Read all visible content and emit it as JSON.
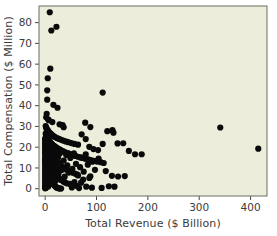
{
  "chart_data": {
    "type": "scatter",
    "title": "",
    "subtitle": "",
    "xlabel": "Total Revenue ($ Billion)",
    "ylabel": "Total Compensation ($ Million)",
    "xlim": [
      -12,
      432
    ],
    "ylim": [
      -3.5,
      88
    ],
    "xticks": [
      0,
      100,
      200,
      300,
      400
    ],
    "yticks": [
      0,
      10,
      20,
      30,
      40,
      50,
      60,
      70,
      80
    ],
    "xtick_labels": [
      "0",
      "100",
      "200",
      "300",
      "400"
    ],
    "ytick_labels": [
      "0",
      "10",
      "20",
      "30",
      "40",
      "50",
      "60",
      "70",
      "80"
    ],
    "grid": false,
    "legend": null,
    "legend_position": "none",
    "marker": "filled-circle",
    "marker_color": "#0a0a0a",
    "marker_size_px": 3.1,
    "plot_background_color": "#ECEDDA",
    "figure_background_color": "#FFFFFF",
    "axis_frame_color": "#6E6E62",
    "text_color": "#3B3B3B",
    "n_points": 318,
    "annotations": [],
    "points": [
      [
        9,
        85.0
      ],
      [
        12,
        76.2
      ],
      [
        22,
        78.0
      ],
      [
        10,
        57.8
      ],
      [
        5,
        53.2
      ],
      [
        4,
        47.4
      ],
      [
        4,
        42.9
      ],
      [
        16,
        40.4
      ],
      [
        24,
        39.0
      ],
      [
        112,
        46.3
      ],
      [
        3,
        36.1
      ],
      [
        2,
        34.4
      ],
      [
        6,
        33.3
      ],
      [
        7,
        33.0
      ],
      [
        14,
        32.1
      ],
      [
        28,
        31.0
      ],
      [
        34,
        30.6
      ],
      [
        36,
        29.6
      ],
      [
        78,
        31.8
      ],
      [
        88,
        29.7
      ],
      [
        341,
        29.5
      ],
      [
        415,
        19.3
      ],
      [
        1,
        30.2
      ],
      [
        2,
        29.4
      ],
      [
        3,
        28.8
      ],
      [
        5,
        28.2
      ],
      [
        6,
        27.6
      ],
      [
        8,
        27.1
      ],
      [
        10,
        26.7
      ],
      [
        12,
        26.2
      ],
      [
        14,
        25.7
      ],
      [
        17,
        25.2
      ],
      [
        20,
        24.8
      ],
      [
        23,
        24.4
      ],
      [
        27,
        24.0
      ],
      [
        31,
        23.6
      ],
      [
        35,
        23.2
      ],
      [
        40,
        22.8
      ],
      [
        45,
        22.4
      ],
      [
        51,
        22.0
      ],
      [
        57,
        21.6
      ],
      [
        64,
        21.2
      ],
      [
        71,
        26.2
      ],
      [
        79,
        23.9
      ],
      [
        86,
        20.2
      ],
      [
        94,
        19.1
      ],
      [
        103,
        18.6
      ],
      [
        112,
        21.6
      ],
      [
        121,
        27.7
      ],
      [
        131,
        28.2
      ],
      [
        133,
        27.0
      ],
      [
        141,
        21.8
      ],
      [
        152,
        21.9
      ],
      [
        163,
        18.2
      ],
      [
        175,
        16.6
      ],
      [
        188,
        16.6
      ],
      [
        1,
        26.5
      ],
      [
        2,
        25.9
      ],
      [
        2,
        25.4
      ],
      [
        3,
        25.0
      ],
      [
        4,
        24.6
      ],
      [
        5,
        24.2
      ],
      [
        6,
        23.8
      ],
      [
        7,
        23.4
      ],
      [
        8,
        23.0
      ],
      [
        9,
        22.6
      ],
      [
        10,
        22.2
      ],
      [
        11,
        21.9
      ],
      [
        13,
        21.5
      ],
      [
        14,
        21.2
      ],
      [
        16,
        20.8
      ],
      [
        18,
        20.5
      ],
      [
        20,
        20.1
      ],
      [
        22,
        19.8
      ],
      [
        24,
        19.4
      ],
      [
        26,
        19.1
      ],
      [
        29,
        18.8
      ],
      [
        31,
        18.4
      ],
      [
        34,
        18.1
      ],
      [
        37,
        17.8
      ],
      [
        40,
        17.4
      ],
      [
        44,
        17.1
      ],
      [
        47,
        16.8
      ],
      [
        51,
        16.4
      ],
      [
        55,
        16.1
      ],
      [
        59,
        15.8
      ],
      [
        64,
        15.4
      ],
      [
        68,
        15.1
      ],
      [
        73,
        14.8
      ],
      [
        78,
        14.4
      ],
      [
        84,
        14.1
      ],
      [
        89,
        13.8
      ],
      [
        95,
        13.4
      ],
      [
        101,
        13.1
      ],
      [
        108,
        12.8
      ],
      [
        114,
        12.4
      ],
      [
        1,
        22.4
      ],
      [
        1,
        22.0
      ],
      [
        2,
        21.6
      ],
      [
        2,
        21.2
      ],
      [
        3,
        20.8
      ],
      [
        3,
        20.4
      ],
      [
        4,
        20.0
      ],
      [
        4,
        19.6
      ],
      [
        5,
        19.2
      ],
      [
        5,
        18.8
      ],
      [
        6,
        18.4
      ],
      [
        7,
        18.0
      ],
      [
        7,
        17.7
      ],
      [
        8,
        17.3
      ],
      [
        9,
        16.9
      ],
      [
        10,
        16.5
      ],
      [
        11,
        16.1
      ],
      [
        12,
        15.7
      ],
      [
        13,
        15.3
      ],
      [
        14,
        14.9
      ],
      [
        15,
        14.5
      ],
      [
        17,
        14.1
      ],
      [
        18,
        13.7
      ],
      [
        19,
        13.3
      ],
      [
        21,
        12.9
      ],
      [
        23,
        12.5
      ],
      [
        24,
        12.1
      ],
      [
        26,
        11.7
      ],
      [
        28,
        11.3
      ],
      [
        30,
        10.9
      ],
      [
        33,
        10.5
      ],
      [
        35,
        10.1
      ],
      [
        38,
        9.7
      ],
      [
        41,
        9.3
      ],
      [
        44,
        8.9
      ],
      [
        47,
        8.5
      ],
      [
        51,
        8.1
      ],
      [
        54,
        7.7
      ],
      [
        58,
        7.3
      ],
      [
        62,
        6.9
      ],
      [
        1,
        18.2
      ],
      [
        1,
        17.8
      ],
      [
        1,
        17.4
      ],
      [
        2,
        17.0
      ],
      [
        2,
        16.6
      ],
      [
        2,
        16.2
      ],
      [
        3,
        15.8
      ],
      [
        3,
        15.4
      ],
      [
        3,
        15.0
      ],
      [
        4,
        14.6
      ],
      [
        4,
        14.2
      ],
      [
        5,
        13.8
      ],
      [
        5,
        13.4
      ],
      [
        6,
        13.0
      ],
      [
        6,
        12.6
      ],
      [
        7,
        12.2
      ],
      [
        7,
        11.8
      ],
      [
        8,
        11.4
      ],
      [
        9,
        11.0
      ],
      [
        9,
        10.6
      ],
      [
        10,
        10.2
      ],
      [
        11,
        9.8
      ],
      [
        12,
        9.4
      ],
      [
        13,
        9.0
      ],
      [
        14,
        8.6
      ],
      [
        15,
        8.2
      ],
      [
        16,
        7.8
      ],
      [
        17,
        7.4
      ],
      [
        19,
        7.0
      ],
      [
        20,
        6.6
      ],
      [
        22,
        6.2
      ],
      [
        23,
        5.8
      ],
      [
        25,
        5.4
      ],
      [
        27,
        5.0
      ],
      [
        29,
        4.6
      ],
      [
        31,
        4.2
      ],
      [
        34,
        3.8
      ],
      [
        36,
        3.4
      ],
      [
        39,
        3.0
      ],
      [
        42,
        2.6
      ],
      [
        1,
        14.4
      ],
      [
        1,
        14.0
      ],
      [
        1,
        13.6
      ],
      [
        1,
        13.2
      ],
      [
        2,
        12.8
      ],
      [
        2,
        12.4
      ],
      [
        2,
        12.0
      ],
      [
        2,
        11.6
      ],
      [
        3,
        11.2
      ],
      [
        3,
        10.8
      ],
      [
        3,
        10.4
      ],
      [
        4,
        10.0
      ],
      [
        4,
        9.6
      ],
      [
        4,
        9.2
      ],
      [
        5,
        8.8
      ],
      [
        5,
        8.4
      ],
      [
        6,
        8.0
      ],
      [
        6,
        7.6
      ],
      [
        7,
        7.2
      ],
      [
        7,
        6.8
      ],
      [
        8,
        6.4
      ],
      [
        8,
        6.0
      ],
      [
        9,
        5.6
      ],
      [
        10,
        5.2
      ],
      [
        10,
        4.8
      ],
      [
        11,
        4.4
      ],
      [
        12,
        4.0
      ],
      [
        13,
        3.6
      ],
      [
        14,
        3.2
      ],
      [
        15,
        2.8
      ],
      [
        16,
        2.4
      ],
      [
        17,
        2.0
      ],
      [
        18,
        1.6
      ],
      [
        20,
        1.2
      ],
      [
        21,
        0.8
      ],
      [
        23,
        0.5
      ],
      [
        25,
        0.3
      ],
      [
        27,
        0.2
      ],
      [
        29,
        0.1
      ],
      [
        31,
        0.1
      ],
      [
        0,
        24.2
      ],
      [
        0,
        23.0
      ],
      [
        0,
        21.8
      ],
      [
        0,
        20.6
      ],
      [
        0,
        19.4
      ],
      [
        0,
        18.2
      ],
      [
        0,
        17.0
      ],
      [
        0,
        15.8
      ],
      [
        0,
        14.6
      ],
      [
        0,
        13.4
      ],
      [
        0,
        12.2
      ],
      [
        0,
        11.0
      ],
      [
        0,
        9.8
      ],
      [
        0,
        8.6
      ],
      [
        0,
        7.4
      ],
      [
        0,
        6.2
      ],
      [
        0,
        5.0
      ],
      [
        0,
        3.8
      ],
      [
        0,
        2.6
      ],
      [
        0,
        1.4
      ],
      [
        0,
        0.6
      ],
      [
        0,
        0.2
      ],
      [
        1,
        24.0
      ],
      [
        1,
        23.2
      ],
      [
        1,
        20.4
      ],
      [
        1,
        19.0
      ],
      [
        1,
        12.0
      ],
      [
        1,
        9.0
      ],
      [
        1,
        6.0
      ],
      [
        1,
        3.0
      ],
      [
        1,
        1.5
      ],
      [
        1,
        0.4
      ],
      [
        2,
        23.5
      ],
      [
        2,
        19.9
      ],
      [
        2,
        10.5
      ],
      [
        2,
        7.5
      ],
      [
        2,
        4.5
      ],
      [
        2,
        2.0
      ],
      [
        2,
        0.6
      ],
      [
        3,
        22.6
      ],
      [
        3,
        18.5
      ],
      [
        3,
        13.9
      ],
      [
        3,
        8.3
      ],
      [
        3,
        5.1
      ],
      [
        3,
        1.8
      ],
      [
        4,
        21.4
      ],
      [
        4,
        17.1
      ],
      [
        4,
        12.3
      ],
      [
        4,
        6.7
      ],
      [
        4,
        3.5
      ],
      [
        5,
        20.9
      ],
      [
        5,
        16.3
      ],
      [
        5,
        11.1
      ],
      [
        5,
        7.9
      ],
      [
        5,
        2.2
      ],
      [
        6,
        22.1
      ],
      [
        6,
        15.2
      ],
      [
        6,
        10.3
      ],
      [
        6,
        4.9
      ],
      [
        6,
        1.1
      ],
      [
        7,
        19.6
      ],
      [
        7,
        14.3
      ],
      [
        7,
        9.5
      ],
      [
        7,
        3.3
      ],
      [
        8,
        21.0
      ],
      [
        8,
        16.9
      ],
      [
        8,
        12.7
      ],
      [
        8,
        5.5
      ],
      [
        9,
        18.9
      ],
      [
        9,
        13.9
      ],
      [
        9,
        8.1
      ],
      [
        9,
        2.4
      ],
      [
        10,
        20.5
      ],
      [
        10,
        15.5
      ],
      [
        10,
        6.5
      ],
      [
        11,
        17.6
      ],
      [
        11,
        11.5
      ],
      [
        11,
        3.9
      ],
      [
        12,
        19.4
      ],
      [
        12,
        14.0
      ],
      [
        12,
        7.0
      ],
      [
        13,
        16.2
      ],
      [
        13,
        10.0
      ],
      [
        13,
        2.8
      ],
      [
        14,
        18.3
      ],
      [
        14,
        12.6
      ],
      [
        14,
        5.9
      ],
      [
        15,
        20.0
      ],
      [
        15,
        9.1
      ],
      [
        16,
        15.0
      ],
      [
        16,
        4.3
      ],
      [
        17,
        17.4
      ],
      [
        17,
        11.0
      ],
      [
        18,
        13.2
      ],
      [
        18,
        6.3
      ],
      [
        19,
        16.0
      ],
      [
        19,
        9.7
      ],
      [
        20,
        11.9
      ],
      [
        20,
        3.7
      ],
      [
        21,
        14.6
      ],
      [
        22,
        8.8
      ],
      [
        23,
        17.2
      ],
      [
        24,
        10.8
      ],
      [
        25,
        14.9
      ],
      [
        26,
        7.2
      ],
      [
        28,
        16.8
      ],
      [
        30,
        12.4
      ],
      [
        32,
        9.0
      ],
      [
        33,
        18.0
      ],
      [
        36,
        13.6
      ],
      [
        38,
        5.8
      ],
      [
        41,
        16.2
      ],
      [
        43,
        11.3
      ],
      [
        46,
        7.8
      ],
      [
        49,
        14.8
      ],
      [
        53,
        9.6
      ],
      [
        56,
        17.0
      ],
      [
        60,
        12.0
      ],
      [
        64,
        6.4
      ],
      [
        68,
        10.4
      ],
      [
        71,
        15.0
      ],
      [
        75,
        8.2
      ],
      [
        79,
        16.5
      ],
      [
        83,
        11.6
      ],
      [
        88,
        6.0
      ],
      [
        92,
        13.0
      ],
      [
        97,
        9.1
      ],
      [
        104,
        14.5
      ],
      [
        110,
        0.4
      ],
      [
        118,
        8.5
      ],
      [
        124,
        1.2
      ],
      [
        130,
        6.2
      ],
      [
        135,
        1.0
      ],
      [
        142,
        5.9
      ],
      [
        155,
        6.1
      ],
      [
        48,
        2.3
      ],
      [
        52,
        0.6
      ],
      [
        57,
        3.2
      ],
      [
        61,
        1.4
      ],
      [
        66,
        0.3
      ],
      [
        70,
        2.9
      ],
      [
        74,
        4.4
      ],
      [
        80,
        1.0
      ],
      [
        86,
        5.2
      ],
      [
        91,
        0.5
      ]
    ]
  }
}
